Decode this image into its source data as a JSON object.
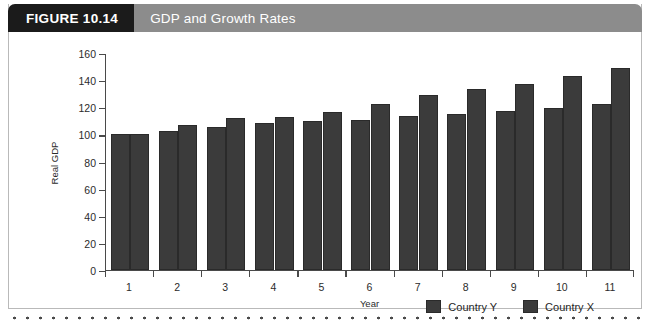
{
  "figure": {
    "number_label": "FIGURE 10.14",
    "title": "GDP and Growth Rates"
  },
  "chart_data": {
    "type": "bar",
    "title": "GDP and Growth Rates",
    "xlabel": "Year",
    "ylabel": "Real GDP",
    "categories": [
      "1",
      "2",
      "3",
      "4",
      "5",
      "6",
      "7",
      "8",
      "9",
      "10",
      "11"
    ],
    "ylim": [
      0,
      160
    ],
    "y_ticks": [
      0,
      20,
      40,
      60,
      80,
      100,
      120,
      140,
      160
    ],
    "grid": false,
    "legend_position": "bottom-right",
    "series": [
      {
        "name": "Country Y",
        "color": "#3b3b3b",
        "values": [
          100,
          102,
          105.5,
          108,
          109.5,
          110.5,
          113.5,
          114.5,
          117,
          119.5,
          122
        ]
      },
      {
        "name": "Country X",
        "color": "#3b3b3b",
        "values": [
          100,
          107,
          112,
          112.5,
          116,
          122,
          128.5,
          133,
          137,
          142.5,
          148.5
        ]
      }
    ]
  }
}
